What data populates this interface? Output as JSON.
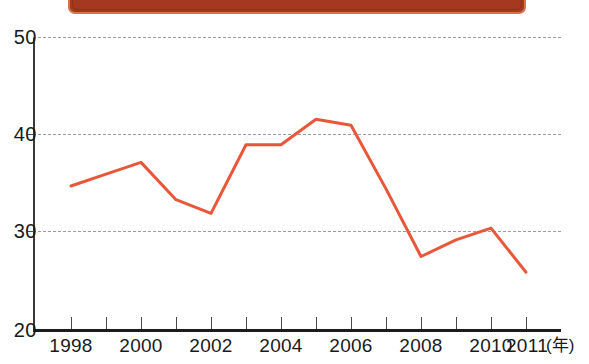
{
  "banner": {
    "name": "title-banner-cropped",
    "fill_color": "#a4391f",
    "border_color": "#d9714f"
  },
  "axes": {
    "y_tick_labels": [
      "50",
      "40",
      "30",
      "20"
    ],
    "x_tick_labels": [
      "1998",
      "2000",
      "2002",
      "2004",
      "2006",
      "2008",
      "2010",
      "2011"
    ],
    "x_unit_label": "(年)"
  },
  "chart_data": {
    "type": "line",
    "title": "",
    "subtitle": "",
    "xlabel": "(年)",
    "ylabel": "",
    "xlim": [
      1998,
      2011
    ],
    "ylim": [
      20,
      50
    ],
    "grid": true,
    "gridlines_y": [
      50,
      40,
      30
    ],
    "legend": [],
    "legend_position": "none",
    "line_color": "#e8573a",
    "line_width": 3,
    "markers": false,
    "x": [
      1998,
      1999,
      2000,
      2001,
      2002,
      2003,
      2004,
      2005,
      2006,
      2007,
      2008,
      2009,
      2010,
      2011
    ],
    "categories": [
      "1998",
      "1999",
      "2000",
      "2001",
      "2002",
      "2003",
      "2004",
      "2005",
      "2006",
      "2007",
      "2008",
      "2009",
      "2010",
      "2011"
    ],
    "values": [
      34.8,
      36.0,
      37.2,
      33.4,
      32.0,
      39.0,
      39.0,
      41.6,
      41.0,
      34.5,
      27.6,
      29.3,
      30.5,
      26.0
    ],
    "y_ticks": [
      20,
      30,
      40,
      50
    ],
    "x_ticks": [
      1998,
      1999,
      2000,
      2001,
      2002,
      2003,
      2004,
      2005,
      2006,
      2007,
      2008,
      2009,
      2010,
      2011
    ],
    "x_tick_labels_shown": [
      "1998",
      "2000",
      "2002",
      "2004",
      "2006",
      "2008",
      "2010",
      "2011"
    ],
    "annotations": []
  }
}
